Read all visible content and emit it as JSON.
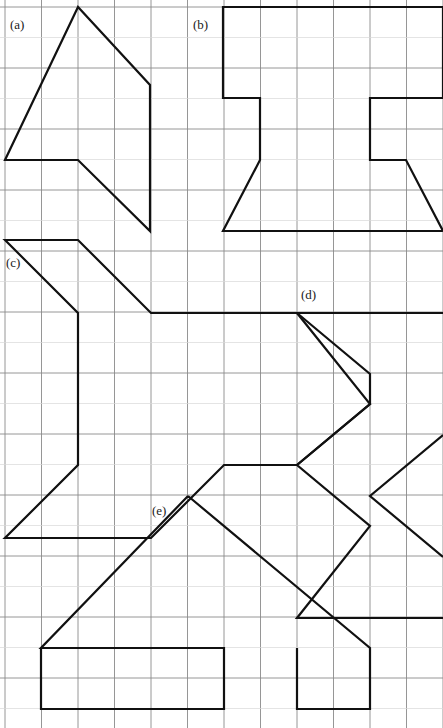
{
  "figure": {
    "width": 443,
    "height": 728,
    "background_color": "#ffffff",
    "stroke_color": "#111111",
    "grid": {
      "origin_x": 5,
      "origin_y": 7,
      "cell_width": 36.5,
      "cell_height": 30.5,
      "columns": 12,
      "rows": 24,
      "major_line_color": "#8a8a8a",
      "minor_line_color": "#d8d8d8",
      "major_every_rows": 2,
      "major_every_cols": 1
    },
    "labels": [
      {
        "id": "a",
        "text": "(a)",
        "x": 10,
        "y": 18
      },
      {
        "id": "b",
        "text": "(b)",
        "x": 193,
        "y": 18
      },
      {
        "id": "c",
        "text": "(c)",
        "x": 6,
        "y": 256
      },
      {
        "id": "d",
        "text": "(d)",
        "x": 301,
        "y": 288
      },
      {
        "id": "e",
        "text": "(e)",
        "x": 152,
        "y": 504
      }
    ],
    "shapes": [
      {
        "id": "a",
        "name": "shape-a-polygon",
        "closed": false,
        "points": "78,7 5,160 78,160 150,231 150,85 78,7"
      },
      {
        "id": "b",
        "name": "shape-b-polygon",
        "closed": false,
        "points": "223,7 223,98 260,98 260,160 223,231 443,231 407,160 370,160 370,98 443,98 443,7 223,7"
      },
      {
        "id": "c",
        "name": "shape-c-polygon",
        "closed": false,
        "points": "5,240 78,313 78,465 5,538 151,538 224,465 297,465 370,404 370,374 297,313 151,313 78,240 5,240"
      },
      {
        "id": "d",
        "name": "shape-d-zigzag",
        "closed": false,
        "points": "443,313 297,313 370,404 297,465 370,526 297,618 443,618 443,557 370,496 443,435 443,313"
      },
      {
        "id": "e",
        "name": "shape-e-polygon",
        "closed": false,
        "points": "188,496 41,648 188,648 188,709 41,709 41,648 297,648 297,709 224,709 224,648 297,648 370,709 370,648 297,648 370,648 188,496"
      }
    ],
    "shape_segments": [
      {
        "id": "a",
        "name": "shape-a-outline",
        "paths": [
          "M78,7 L5,160 L78,160 L150,231 L150,85 Z"
        ]
      },
      {
        "id": "b",
        "name": "shape-b-outline",
        "paths": [
          "M223,7 L223,98 L260,98 L260,160 L223,231 L443,231 L406,160 L370,160 L370,98 L443,98 L443,7 Z"
        ]
      },
      {
        "id": "c",
        "name": "shape-c-outline",
        "paths": [
          "M5,240 L78,313 L78,465 L5,538 L151,538 L224,465 L297,465 L370,404 L370,374 L297,313 L151,313 L78,240 Z"
        ]
      },
      {
        "id": "d",
        "name": "shape-d-outline",
        "paths": [
          "M443,313 L297,313 L370,404 L297,465 L370,526 L297,618 L443,618 M443,435 L370,496 L443,557"
        ]
      },
      {
        "id": "e",
        "name": "shape-e-outline",
        "paths": [
          "M188,496 L41,648 L224,648 L224,709 L41,709 L41,648 M297,648 L297,709 L370,709 L370,648 L188,496"
        ]
      }
    ]
  }
}
